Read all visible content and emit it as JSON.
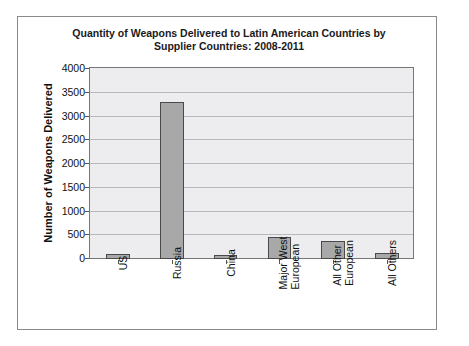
{
  "chart_data": {
    "type": "bar",
    "title": "Quantity of Weapons Delivered to Latin American Countries by Supplier Countries: 2008-2011",
    "title_lines": [
      "Quantity of Weapons Delivered to Latin American Countries by",
      "Supplier Countries: 2008-2011"
    ],
    "xlabel": "",
    "ylabel": "Number of Weapons Delivered",
    "categories": [
      "US",
      "Russia",
      "China",
      "Major West European",
      "All Other European",
      "All Others"
    ],
    "category_lines": [
      [
        "US"
      ],
      [
        "Russia"
      ],
      [
        "China"
      ],
      [
        "Major West",
        "European"
      ],
      [
        "All Other",
        "European"
      ],
      [
        "All Others"
      ]
    ],
    "values": [
      100,
      3300,
      80,
      470,
      370,
      130
    ],
    "ylim": [
      0,
      4000
    ],
    "yticks": [
      0,
      500,
      1000,
      1500,
      2000,
      2500,
      3000,
      3500,
      4000
    ],
    "ytick_labels": [
      "0",
      "500",
      "1000",
      "1500",
      "2000",
      "2500",
      "3000",
      "3500",
      "4000"
    ],
    "grid": true,
    "legend": false,
    "bar_color": "#a8a8a8",
    "bar_border_color": "#4a4a4a",
    "plot_background": "#ededf0",
    "frame_color": "#8a8a8a"
  }
}
